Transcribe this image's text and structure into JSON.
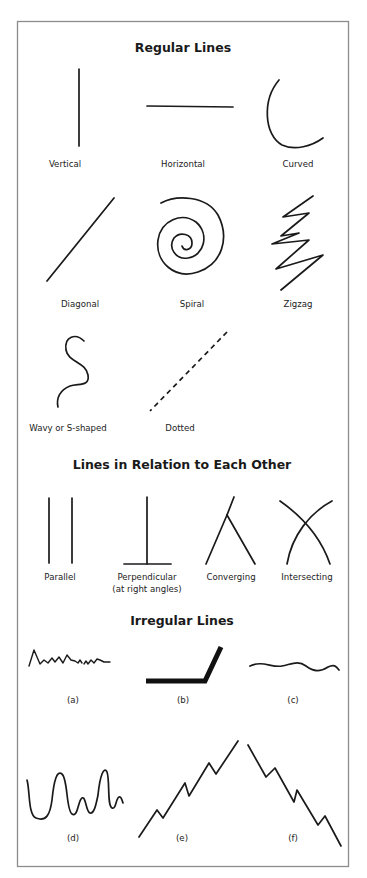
{
  "diagram": {
    "frame_color": "#8c8c8c",
    "line_color": "#1a1a1a",
    "sections": [
      {
        "id": "regular",
        "title": "Regular Lines",
        "items": [
          {
            "label": "Vertical",
            "shape": "vertical"
          },
          {
            "label": "Horizontal",
            "shape": "horizontal"
          },
          {
            "label": "Curved",
            "shape": "curved"
          },
          {
            "label": "Diagonal",
            "shape": "diagonal"
          },
          {
            "label": "Spiral",
            "shape": "spiral"
          },
          {
            "label": "Zigzag",
            "shape": "zigzag"
          },
          {
            "label": "Wavy or S-shaped",
            "shape": "s-shaped"
          },
          {
            "label": "Dotted",
            "shape": "dashed"
          }
        ]
      },
      {
        "id": "relation",
        "title": "Lines in Relation to Each Other",
        "items": [
          {
            "label": "Parallel",
            "shape": "parallel"
          },
          {
            "label": "Perpendicular",
            "label_line2": "(at right angles)",
            "shape": "perpendicular"
          },
          {
            "label": "Converging",
            "shape": "converging"
          },
          {
            "label": "Intersecting",
            "shape": "intersecting"
          }
        ]
      },
      {
        "id": "irregular",
        "title": "Irregular Lines",
        "items": [
          {
            "label": "(a)",
            "shape": "jagged-scribble"
          },
          {
            "label": "(b)",
            "shape": "thick-bent"
          },
          {
            "label": "(c)",
            "shape": "gentle-wave"
          },
          {
            "label": "(d)",
            "shape": "loopy-wave"
          },
          {
            "label": "(e)",
            "shape": "rising-zigzag"
          },
          {
            "label": "(f)",
            "shape": "falling-zigzag"
          }
        ]
      }
    ]
  }
}
